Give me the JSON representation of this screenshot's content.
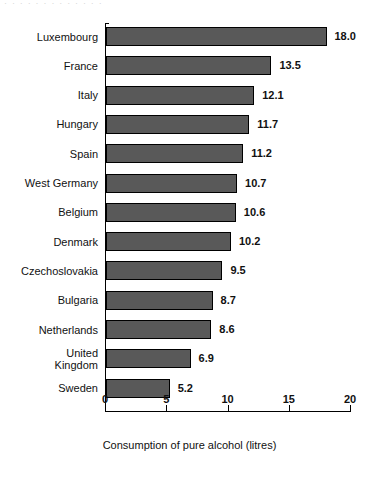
{
  "artifact": {
    "top_remnant_text": "· · · · · · · · · · · · ·"
  },
  "chart_data": {
    "type": "bar",
    "orientation": "horizontal",
    "title": "",
    "xlabel": "Consumption of pure alcohol (litres)",
    "ylabel": "",
    "xlim": [
      0,
      20
    ],
    "xticks": [
      0,
      5,
      10,
      15,
      20
    ],
    "xtick_labels": [
      "0",
      "5",
      "10",
      "15",
      "20"
    ],
    "grid": false,
    "legend": null,
    "bar_color": "#595959",
    "bar_edge_color": "#000000",
    "background_color": "#ffffff",
    "categories": [
      "Luxembourg",
      "France",
      "Italy",
      "Hungary",
      "Spain",
      "West Germany",
      "Belgium",
      "Denmark",
      "Czechoslovakia",
      "Bulgaria",
      "Netherlands",
      "United\nKingdom",
      "Sweden"
    ],
    "values": [
      18.0,
      13.5,
      12.1,
      11.7,
      11.2,
      10.7,
      10.6,
      10.2,
      9.5,
      8.7,
      8.6,
      6.9,
      5.2
    ],
    "value_labels": [
      "18.0",
      "13.5",
      "12.1",
      "11.7",
      "11.2",
      "10.7",
      "10.6",
      "10.2",
      "9.5",
      "8.7",
      "8.6",
      "6.9",
      "5.2"
    ]
  }
}
